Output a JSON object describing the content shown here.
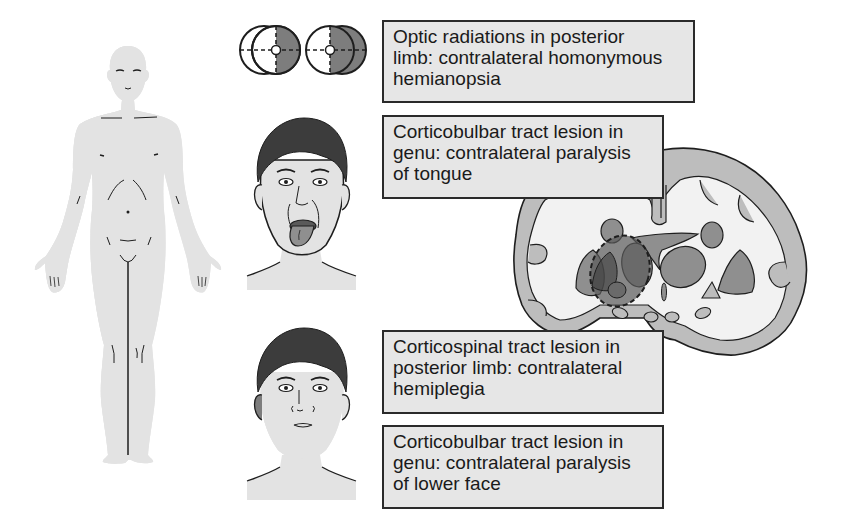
{
  "figure": {
    "colors": {
      "affected_shade": "#7d7d7d",
      "unaffected_skin": "#e3e3e3",
      "box_fill": "#e6e6e6",
      "box_border": "#2a2a2a",
      "outline": "#1e1e1e",
      "hair": "#3c3c3c",
      "cortex_gray": "#bdbdbd",
      "white_matter": "#f2f2f2",
      "nuclei_gray": "#8f8f8f",
      "lesion_dark": "#5a5a5a"
    },
    "panels": {
      "body": {
        "name": "whole-body-hemiplegia-figure",
        "shaded_side": "right-of-body (viewer left)"
      },
      "visual_fields": {
        "name": "visual-field-diagrams",
        "eyes": [
          "left-eye-field",
          "right-eye-field"
        ],
        "shaded_half": "right"
      },
      "face_tongue": {
        "name": "face-tongue-deviation"
      },
      "face_lower": {
        "name": "face-lower-paralysis"
      },
      "brain": {
        "name": "coronal-brain-section",
        "lesion": "posterior limb / genu of internal capsule (dashed outline)"
      }
    }
  },
  "labels": [
    {
      "id": "optic",
      "lines": [
        "Optic radiations in posterior",
        "limb: contralateral homonymous",
        "hemianopsia"
      ]
    },
    {
      "id": "tongue",
      "lines": [
        "Corticobulbar tract lesion in",
        "genu: contralateral paralysis",
        "of tongue"
      ]
    },
    {
      "id": "hemiplegia",
      "lines": [
        "Corticospinal tract lesion in",
        "posterior limb: contralateral",
        "hemiplegia"
      ]
    },
    {
      "id": "lowerface",
      "lines": [
        "Corticobulbar tract lesion in",
        "genu: contralateral paralysis",
        "of lower face"
      ]
    }
  ]
}
